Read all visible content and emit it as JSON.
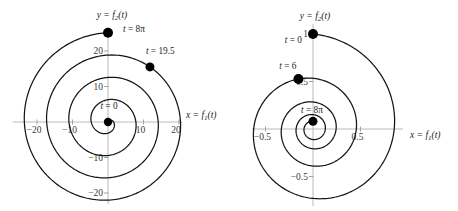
{
  "styles": {
    "background": "#ffffff",
    "curve_color": "#151515",
    "axis_color": "#b3b3b3",
    "tick_color": "#9a9a9a",
    "point_color": "#000000"
  },
  "chart_data": [
    {
      "id": "left-spiral",
      "type": "line",
      "subtype": "parametric-spiral",
      "description": "Outward Archimedean spiral x = t sin t, y = t cos t traced clockwise from t = 0 at the origin to t = 8π",
      "xlabel": {
        "pre": "x = f",
        "sub": "1",
        "post": "(t)"
      },
      "ylabel": {
        "pre": "y = f",
        "sub": "2",
        "post": "(t)"
      },
      "curve": {
        "r_type": "linear",
        "a": 1,
        "decay": 0,
        "t_min": 0,
        "t_max": 25.132741,
        "samples": 900
      },
      "xlim": [
        -30.42,
        34.08
      ],
      "ylim": [
        -25.07,
        34.37
      ],
      "axis_x_range": [
        -26.8,
        20.8
      ],
      "axis_y_range": [
        -23.1,
        26.5
      ],
      "grid": false,
      "xticks": [
        {
          "value": -20,
          "label": "−20"
        },
        {
          "value": -10,
          "label": "−10"
        },
        {
          "value": 10,
          "label": "10"
        },
        {
          "value": 20,
          "label": "20"
        }
      ],
      "yticks": [
        {
          "value": -20,
          "label": "−20"
        },
        {
          "value": -10,
          "label": "−10"
        },
        {
          "value": 10,
          "label": "10"
        },
        {
          "value": 20,
          "label": "20"
        }
      ],
      "points": [
        {
          "t": 0,
          "x": 0,
          "y": 0,
          "label": "t = 0",
          "anchor": "middle",
          "offset": [
            1,
            -13
          ],
          "r": 4.2
        },
        {
          "t": 19.5,
          "x": 11.81,
          "y": 15.52,
          "label": "t = 19.5",
          "anchor": "start",
          "offset": [
            -4,
            -13
          ],
          "r": 4.5
        },
        {
          "t": 25.132741,
          "x": 0,
          "y": 25.133,
          "label": "t = 8π",
          "anchor": "start",
          "offset": [
            15,
            -1
          ],
          "r": 5
        }
      ],
      "layout": {
        "xlabel_pos": [
          186,
          118
        ],
        "ylabel_pos": [
          112,
          18
        ]
      }
    },
    {
      "id": "right-spiral",
      "type": "line",
      "subtype": "parametric-spiral",
      "description": "Inward spiral x = e^(-t/10) sin t, y = e^(-t/10) cos t traced clockwise from t = 0 at (0,1) to t = 8π near the origin",
      "xlabel": {
        "pre": "x = f",
        "sub": "1",
        "post": "(t)"
      },
      "ylabel": {
        "pre": "y = f",
        "sub": "2",
        "post": "(t)"
      },
      "curve": {
        "r_type": "exp",
        "a": 1,
        "decay": 0.1,
        "t_min": 0,
        "t_max": 25.132741,
        "samples": 900
      },
      "xlim": [
        -0.884,
        1.526
      ],
      "ylim": [
        -0.863,
        1.358
      ],
      "axis_x_range": [
        -0.642,
        0.947
      ],
      "axis_y_range": [
        -0.81,
        1.105
      ],
      "grid": false,
      "xticks": [
        {
          "value": -0.5,
          "label": "−0.5"
        },
        {
          "value": 0.5,
          "label": "0.5"
        }
      ],
      "yticks": [
        {
          "value": -0.5,
          "label": "−0.5"
        },
        {
          "value": 0.5,
          "label": "0.5"
        },
        {
          "value": 1,
          "label": "1"
        }
      ],
      "points": [
        {
          "t": 0,
          "x": 0,
          "y": 1,
          "label": "t = 0",
          "anchor": "end",
          "offset": [
            -11,
            9
          ],
          "r": 5
        },
        {
          "t": 6,
          "x": -0.1534,
          "y": 0.5272,
          "label": "t = 6",
          "anchor": "end",
          "offset": [
            -2,
            -10
          ],
          "r": 5
        },
        {
          "t": 25.132741,
          "x": 0,
          "y": 0.0811,
          "label": "t = 8π",
          "anchor": "middle",
          "offset": [
            -1,
            -8
          ],
          "r": 4.5
        }
      ],
      "layout": {
        "xlabel_pos": [
          181,
          138
        ],
        "ylabel_pos": [
          86,
          19
        ]
      }
    }
  ]
}
